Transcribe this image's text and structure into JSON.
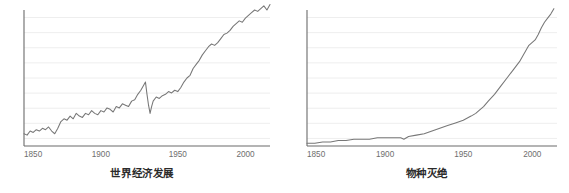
{
  "figure": {
    "background_color": "#ffffff",
    "axis_color": "#6b6b6b",
    "gridline_color": "#eeeeee",
    "line_color": "#777777",
    "tick_label_color": "#6e6e6e",
    "caption_color": "#2b2b2b"
  },
  "charts": [
    {
      "id": "world-economic-development",
      "caption": "世界经济发展",
      "chart_data": {
        "type": "line",
        "title": "世界经济发展",
        "xlabel": "",
        "ylabel": "",
        "xlim": [
          1850,
          2010
        ],
        "ylim": [
          0,
          100
        ],
        "xticks": [
          1850,
          1900,
          1950,
          2000
        ],
        "xtick_labels": [
          "1850",
          "1900",
          "1950",
          "2000"
        ],
        "yticks": [],
        "ytick_labels": [],
        "grid": true,
        "grid_axis": "y",
        "gridline_count": 9,
        "legend": null,
        "series": [
          {
            "name": "世界经济发展",
            "color": "#777777",
            "x": [
              1850,
              1852,
              1854,
              1856,
              1858,
              1860,
              1862,
              1864,
              1866,
              1868,
              1870,
              1872,
              1874,
              1876,
              1878,
              1880,
              1882,
              1884,
              1886,
              1888,
              1890,
              1892,
              1894,
              1896,
              1898,
              1900,
              1902,
              1904,
              1906,
              1908,
              1910,
              1912,
              1914,
              1916,
              1918,
              1920,
              1922,
              1924,
              1926,
              1928,
              1929,
              1930,
              1931,
              1932,
              1933,
              1934,
              1936,
              1938,
              1940,
              1942,
              1944,
              1946,
              1948,
              1950,
              1952,
              1954,
              1956,
              1958,
              1960,
              1962,
              1964,
              1966,
              1968,
              1970,
              1972,
              1974,
              1976,
              1978,
              1980,
              1982,
              1984,
              1986,
              1988,
              1990,
              1992,
              1994,
              1996,
              1998,
              2000,
              2002,
              2004,
              2006,
              2008,
              2010
            ],
            "values": [
              9,
              8,
              11,
              10,
              12,
              11,
              13,
              12,
              14,
              11,
              9,
              13,
              18,
              20,
              19,
              22,
              20,
              24,
              22,
              21,
              24,
              23,
              26,
              24,
              23,
              26,
              25,
              28,
              27,
              25,
              29,
              28,
              31,
              30,
              29,
              33,
              34,
              38,
              41,
              45,
              47,
              38,
              30,
              24,
              29,
              33,
              36,
              35,
              37,
              38,
              40,
              39,
              41,
              40,
              43,
              47,
              50,
              52,
              57,
              60,
              63,
              67,
              70,
              73,
              75,
              74,
              76,
              79,
              82,
              83,
              85,
              88,
              90,
              92,
              91,
              94,
              96,
              98,
              100,
              99,
              101,
              103,
              100,
              104
            ]
          }
        ]
      }
    },
    {
      "id": "species-extinction",
      "caption": "物种灭绝",
      "chart_data": {
        "type": "line",
        "title": "物种灭绝",
        "xlabel": "",
        "ylabel": "",
        "xlim": [
          1850,
          2010
        ],
        "ylim": [
          0,
          100
        ],
        "xticks": [
          1850,
          1900,
          1950,
          2000
        ],
        "xtick_labels": [
          "1850",
          "1900",
          "1950",
          "2000"
        ],
        "yticks": [],
        "ytick_labels": [],
        "grid": true,
        "grid_axis": "y",
        "gridline_count": 9,
        "legend": null,
        "series": [
          {
            "name": "物种灭绝",
            "color": "#777777",
            "x": [
              1850,
              1855,
              1860,
              1865,
              1870,
              1875,
              1880,
              1885,
              1890,
              1895,
              1900,
              1905,
              1910,
              1912,
              1915,
              1920,
              1925,
              1930,
              1935,
              1940,
              1945,
              1950,
              1955,
              1958,
              1960,
              1963,
              1966,
              1970,
              1974,
              1978,
              1982,
              1986,
              1990,
              1992,
              1994,
              1996,
              1998,
              2000,
              2002,
              2004,
              2006,
              2008
            ],
            "values": [
              2,
              2,
              3,
              3,
              4,
              4,
              5,
              5,
              5,
              6,
              6,
              6,
              6,
              5,
              7,
              8,
              9,
              11,
              13,
              15,
              17,
              19,
              22,
              24,
              26,
              29,
              33,
              38,
              44,
              50,
              56,
              62,
              70,
              74,
              76,
              78,
              82,
              87,
              91,
              94,
              97,
              101
            ]
          }
        ]
      }
    }
  ]
}
